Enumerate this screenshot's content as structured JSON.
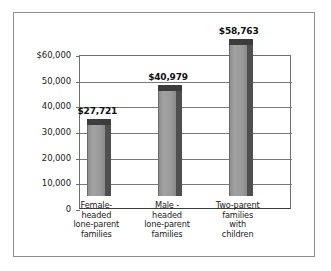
{
  "chart_data": {
    "type": "bar",
    "title": "",
    "subtitle": "",
    "xlabel": "",
    "ylabel": "",
    "ylim": [
      0,
      60000
    ],
    "grid": true,
    "legend": false,
    "legend_position": "none",
    "orientation": "vertical",
    "categories": [
      "Female-headed lone-parent families",
      "Male - headed lone-parent families",
      "Two-parent families with children"
    ],
    "category_lines": [
      [
        "Female-",
        "headed",
        "lone-parent",
        "families"
      ],
      [
        "Male -",
        "headed",
        "lone-parent",
        "families"
      ],
      [
        "Two-parent",
        "families",
        "with",
        "children"
      ]
    ],
    "values": [
      27721,
      40979,
      58763
    ],
    "value_labels": [
      "$27,721",
      "$40,979",
      "$58,763"
    ],
    "ytick_values": [
      60000,
      50000,
      40000,
      30000,
      20000,
      10000,
      0
    ],
    "ytick_labels": [
      "$60,000",
      "50,000",
      "40,000",
      "30,000",
      "20,000",
      "10,000",
      "0"
    ],
    "colors": {
      "bar_face": "#9a9a9a",
      "bar_side": "#4f4f4f",
      "bar_top": "#3c3c3c",
      "gridline": "#7a7a7a",
      "axis": "#3a3a3a",
      "frame": "#8d8d8d",
      "background": "#ffffff",
      "text": "#1b1b1b"
    }
  }
}
